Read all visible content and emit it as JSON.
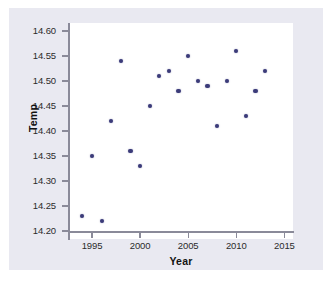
{
  "chart_data": {
    "type": "scatter",
    "title": "",
    "xlabel": "Year",
    "ylabel": "Temp",
    "xlim": [
      1993,
      2016
    ],
    "ylim": [
      14.2,
      14.6
    ],
    "xticks": [
      1995,
      2000,
      2005,
      2010,
      2015
    ],
    "xtick_labels": [
      "1995",
      "2000",
      "2005",
      "2010",
      "2015"
    ],
    "yticks": [
      14.2,
      14.25,
      14.3,
      14.35,
      14.4,
      14.45,
      14.5,
      14.55,
      14.6
    ],
    "ytick_labels": [
      "14.20",
      "14.25",
      "14.30",
      "14.35",
      "14.40",
      "14.45",
      "14.50",
      "14.55",
      "14.60"
    ],
    "grid": false,
    "legend": false,
    "marker_color": "#3b3b79",
    "x": [
      1994,
      1995,
      1996,
      1997,
      1998,
      1999,
      2000,
      2001,
      2002,
      2003,
      2004,
      2005,
      2006,
      2007,
      2008,
      2009,
      2010,
      2011,
      2012,
      2013
    ],
    "y": [
      14.23,
      14.35,
      14.22,
      14.42,
      14.54,
      14.36,
      14.33,
      14.45,
      14.51,
      14.52,
      14.48,
      14.55,
      14.5,
      14.49,
      14.41,
      14.5,
      14.56,
      14.43,
      14.48,
      14.52
    ],
    "points": [
      {
        "x": 1994,
        "y": 14.23
      },
      {
        "x": 1995,
        "y": 14.35
      },
      {
        "x": 1996,
        "y": 14.22
      },
      {
        "x": 1997,
        "y": 14.42
      },
      {
        "x": 1998,
        "y": 14.54
      },
      {
        "x": 1999,
        "y": 14.36
      },
      {
        "x": 2000,
        "y": 14.33
      },
      {
        "x": 2001,
        "y": 14.45
      },
      {
        "x": 2002,
        "y": 14.51
      },
      {
        "x": 2003,
        "y": 14.52
      },
      {
        "x": 2004,
        "y": 14.48
      },
      {
        "x": 2005,
        "y": 14.55
      },
      {
        "x": 2006,
        "y": 14.5
      },
      {
        "x": 2007,
        "y": 14.49
      },
      {
        "x": 2008,
        "y": 14.41
      },
      {
        "x": 2009,
        "y": 14.5
      },
      {
        "x": 2010,
        "y": 14.56
      },
      {
        "x": 2011,
        "y": 14.43
      },
      {
        "x": 2012,
        "y": 14.48
      },
      {
        "x": 2013,
        "y": 14.52
      }
    ]
  },
  "axes": {
    "y_title": "Temp",
    "x_title": "Year"
  },
  "colors": {
    "marker": "#3b3b79",
    "figure_background": "#e9e9f1",
    "panel_background": "#ffffff",
    "axis_line": "#8a8a99",
    "tick_text": "#2b2b2b"
  }
}
